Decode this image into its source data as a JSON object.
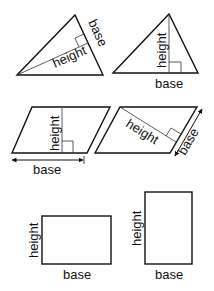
{
  "diagram": {
    "shapes": [
      {
        "id": "triangle-1",
        "type": "triangle",
        "labels": {
          "base": "base",
          "height": "height"
        },
        "note": "base is a slanted side; height drawn perpendicular from opposite vertex"
      },
      {
        "id": "triangle-2",
        "type": "triangle",
        "labels": {
          "base": "base",
          "height": "height"
        },
        "note": "base at bottom; vertical height from apex"
      },
      {
        "id": "parallelogram-1",
        "type": "parallelogram",
        "labels": {
          "base": "base",
          "height": "height"
        },
        "note": "base at bottom with double arrow; vertical height"
      },
      {
        "id": "parallelogram-2",
        "type": "parallelogram",
        "labels": {
          "base": "base",
          "height": "height"
        },
        "note": "base on right slanted side with double arrow; perpendicular height"
      },
      {
        "id": "rectangle-1",
        "type": "rectangle",
        "labels": {
          "base": "base",
          "height": "height"
        },
        "note": "landscape rectangle"
      },
      {
        "id": "rectangle-2",
        "type": "rectangle",
        "labels": {
          "base": "base",
          "height": "height"
        },
        "note": "portrait rectangle"
      }
    ]
  }
}
